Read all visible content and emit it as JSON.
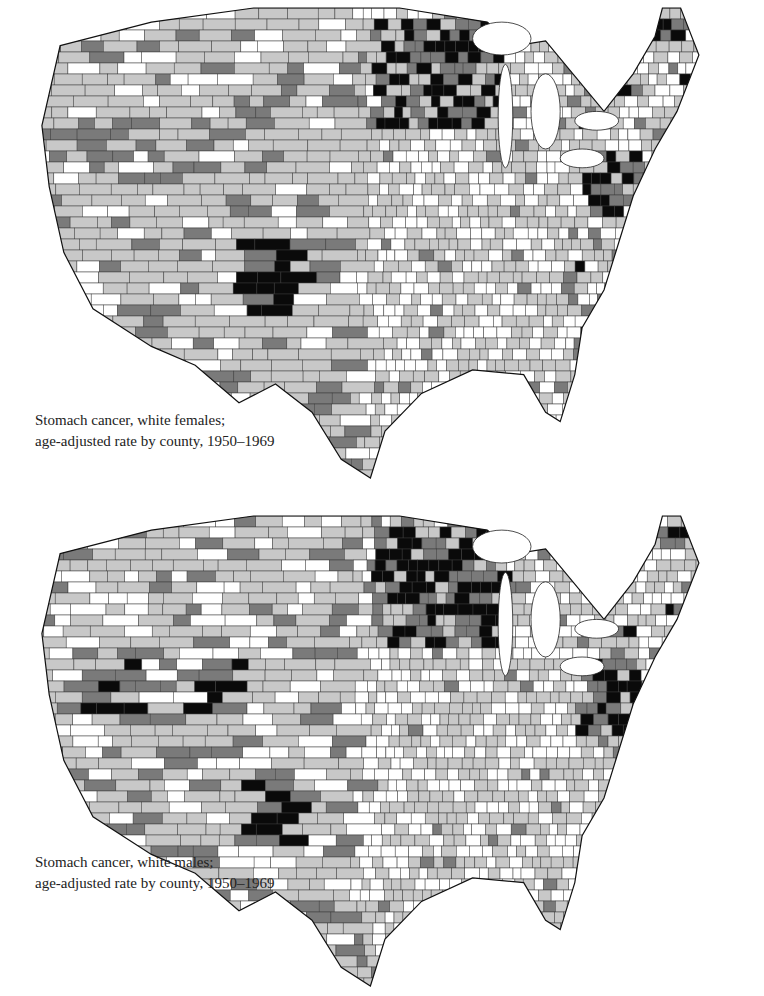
{
  "panels": [
    {
      "id": "females",
      "caption_line1": "Stomach cancer, white females;",
      "caption_line2": "age-adjusted rate by county, 1950–1969"
    },
    {
      "id": "males",
      "caption_line1": "Stomach cancer, white males;",
      "caption_line2": "age-adjusted rate by county, 1950–1969"
    }
  ],
  "legend_shades": {
    "lowest": "#ffffff",
    "low": "#c8c8c8",
    "high": "#7a7a7a",
    "highest": "#0a0a0a"
  },
  "colors": {
    "county_border": "#3a3a3a",
    "background": "#ffffff"
  }
}
